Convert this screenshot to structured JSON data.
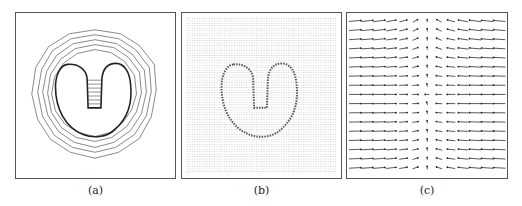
{
  "figure": {
    "panels": [
      {
        "id": "a",
        "caption": "(a)",
        "content": "contour-lines-around-heart-shape"
      },
      {
        "id": "b",
        "caption": "(b)",
        "content": "dense-vector-field-grid"
      },
      {
        "id": "c",
        "caption": "(c)",
        "content": "sparse-arrow-vector-field"
      }
    ],
    "colors": {
      "line": "#444444",
      "border": "#555555",
      "background": "#ffffff"
    }
  }
}
